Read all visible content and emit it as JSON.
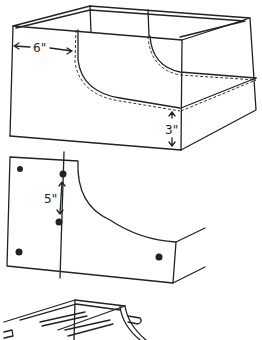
{
  "sketch": {
    "box": {
      "width_label": "6\"",
      "height_label": "3\""
    },
    "panel": {
      "spacing_label": "5\""
    }
  }
}
